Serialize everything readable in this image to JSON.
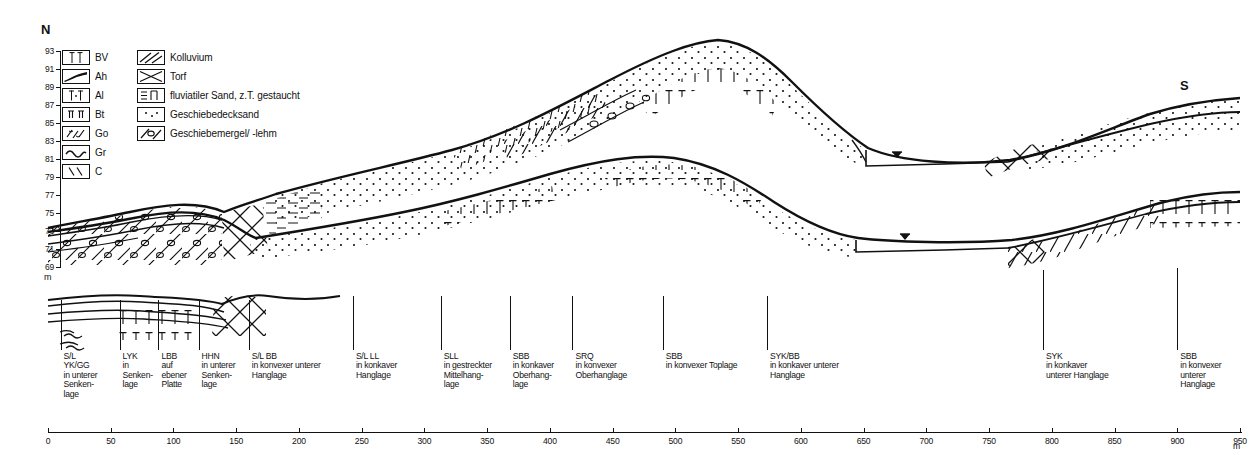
{
  "figure": {
    "type": "geological-soil-catena-cross-section",
    "orientation_left": "N",
    "orientation_right": "S"
  },
  "yaxis": {
    "unit": "m",
    "ticks": [
      "93",
      "91",
      "89",
      "87",
      "85",
      "83",
      "81",
      "79",
      "77",
      "75",
      "73",
      "71",
      "69"
    ],
    "values": [
      93,
      91,
      89,
      87,
      85,
      83,
      81,
      79,
      77,
      75,
      73,
      71,
      69
    ]
  },
  "xaxis": {
    "unit": "m",
    "ticks": [
      "0",
      "50",
      "100",
      "150",
      "200",
      "250",
      "300",
      "350",
      "400",
      "450",
      "500",
      "550",
      "600",
      "650",
      "700",
      "750",
      "800",
      "850",
      "900",
      "950"
    ],
    "values": [
      0,
      50,
      100,
      150,
      200,
      250,
      300,
      350,
      400,
      450,
      500,
      550,
      600,
      650,
      700,
      750,
      800,
      850,
      900,
      950
    ],
    "min": 0,
    "max": 950
  },
  "legend": {
    "horizons": [
      {
        "code": "BV",
        "pattern": "bv-icon"
      },
      {
        "code": "Ah",
        "pattern": "ah-icon"
      },
      {
        "code": "Al",
        "pattern": "al-icon"
      },
      {
        "code": "Bt",
        "pattern": "bt-icon"
      },
      {
        "code": "Go",
        "pattern": "go-icon"
      },
      {
        "code": "Gr",
        "pattern": "gr-icon"
      },
      {
        "code": "C",
        "pattern": "c-icon"
      }
    ],
    "substrates": [
      {
        "label": "Kolluvium",
        "pattern": "kolluvium-icon"
      },
      {
        "label": "Torf",
        "pattern": "torf-icon"
      },
      {
        "label": "fluviatiler Sand, z.T. gestaucht",
        "pattern": "fluviatiler-sand-icon"
      },
      {
        "label": "Geschiebedecksand",
        "pattern": "geschiebedecksand-icon"
      },
      {
        "label": "Geschiebemergel/ -lehm",
        "pattern": "geschiebemergel-icon"
      }
    ]
  },
  "profiles": [
    {
      "id": "p1",
      "x_m": 10,
      "code": "S/L\nYK/GG",
      "position": "in unterer\nSenken-\nlage"
    },
    {
      "id": "p2",
      "x_m": 57,
      "code": "LYK",
      "position": "in\nSenken-\nlage"
    },
    {
      "id": "p3",
      "x_m": 88,
      "code": "LBB",
      "position": "auf\nebener\nPlatte"
    },
    {
      "id": "p4",
      "x_m": 120,
      "code": "HHN",
      "position": "in unterer\nSenken-\nlage"
    },
    {
      "id": "p5",
      "x_m": 160,
      "code": "S/L BB",
      "position": "in konvexer unterer\nHanglage"
    },
    {
      "id": "p6",
      "x_m": 243,
      "code": "S/L LL",
      "position": "in konkaver\nHanglage"
    },
    {
      "id": "p7",
      "x_m": 313,
      "code": "SLL",
      "position": "in gestreckter\nMittelhang-\nlage"
    },
    {
      "id": "p8",
      "x_m": 368,
      "code": "SBB",
      "position": "in konkaver\nOberhang-\nlage"
    },
    {
      "id": "p9",
      "x_m": 418,
      "code": "SRQ",
      "position": "in konvexer\nOberhanglage"
    },
    {
      "id": "p10",
      "x_m": 490,
      "code": "SBB",
      "position": "in konvexer Toplage"
    },
    {
      "id": "p11",
      "x_m": 573,
      "code": "SYK/BB",
      "position": "in konkaver unterer\nHanglage"
    },
    {
      "id": "p12",
      "x_m": 793,
      "code": "SYK",
      "position": "in konkaver\nunterer Hanglage"
    },
    {
      "id": "p13",
      "x_m": 900,
      "code": "SBB",
      "position": "in konvexer\nunterer\nHanglage"
    }
  ],
  "colors": {
    "ink": "#111111",
    "paper": "#ffffff"
  }
}
